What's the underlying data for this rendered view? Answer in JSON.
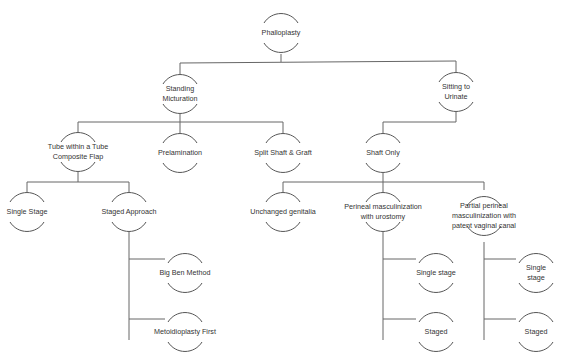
{
  "diagram": {
    "title": "Phalloplasty",
    "colors": {
      "line": "#666666",
      "arc": "#555555",
      "text": "#333333",
      "background": "#ffffff"
    },
    "nodes": [
      {
        "id": "phalloplasty",
        "label": "Phalloplasty",
        "x": 281,
        "y": 33
      },
      {
        "id": "standing",
        "label": "Standing\nMicturation",
        "x": 180,
        "y": 94
      },
      {
        "id": "sitting",
        "label": "Sitting to\nUrinate",
        "x": 456,
        "y": 92
      },
      {
        "id": "tube",
        "label": "Tube within a Tube\nComposite Flap",
        "x": 78,
        "y": 152
      },
      {
        "id": "prelamination",
        "label": "Prelamination",
        "x": 180,
        "y": 153
      },
      {
        "id": "splitshaft",
        "label": "Split Shaft & Graft",
        "x": 283,
        "y": 153
      },
      {
        "id": "shaftonly",
        "label": "Shaft Only",
        "x": 383,
        "y": 153
      },
      {
        "id": "singlestage",
        "label": "Single Stage",
        "x": 27,
        "y": 212
      },
      {
        "id": "stagedapproach",
        "label": "Staged Approach",
        "x": 129,
        "y": 212
      },
      {
        "id": "unchanged",
        "label": "Unchanged genitalia",
        "x": 283,
        "y": 212
      },
      {
        "id": "perineal",
        "label": "Perineal masculinization\nwith urostomy",
        "x": 383,
        "y": 212
      },
      {
        "id": "partial",
        "label": "Partial perineal\nmasculinization with\npatent vaginal canal",
        "x": 484,
        "y": 216
      },
      {
        "id": "bigben",
        "label": "Big Ben Method",
        "x": 185,
        "y": 273
      },
      {
        "id": "metoidio",
        "label": "Metoidioplasty First",
        "x": 185,
        "y": 332
      },
      {
        "id": "perineal_single",
        "label": "Single stage",
        "x": 436,
        "y": 273
      },
      {
        "id": "perineal_staged",
        "label": "Staged",
        "x": 436,
        "y": 332
      },
      {
        "id": "partial_single",
        "label": "Single stage",
        "x": 536,
        "y": 273
      },
      {
        "id": "partial_staged",
        "label": "Staged",
        "x": 536,
        "y": 332
      }
    ],
    "edges": [
      "M281,54 L281,62 M180,63 L456,61 M180,63 L180,74 M456,61 L456,72",
      "M180,114 L180,122 M78,122 L283,122 M78,122 L78,132 M180,122 L180,133 M283,122 L283,133",
      "M456,112 L456,122 M383,122 L456,122 M383,122 L383,133",
      "M78,172 L78,182 M27,182 L129,182 M27,182 L27,192 M129,182 L129,192",
      "M383,173 L383,182 M283,182 L484,182 M283,182 L283,192 M383,182 L383,192 M484,182 L484,190",
      "M129,232 L129,340 M129,259 L165,259 M129,319 L165,319",
      "M383,232 L383,340 M383,259 L416,259 M383,319 L416,319",
      "M484,242 L484,340 M484,259 L516,259 M484,319 L516,319"
    ]
  }
}
